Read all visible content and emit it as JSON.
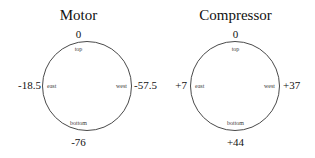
{
  "figure": {
    "background_color": "#ffffff",
    "stroke_color": "#4a4a4a",
    "text_color": "#111111"
  },
  "panels": [
    {
      "title": "Motor",
      "labels": {
        "top": "top",
        "bottom": "bottom",
        "east": "east",
        "west": "west"
      },
      "values": {
        "top": "0",
        "bottom": "-76",
        "east": "-18.5",
        "west": "-57.5"
      }
    },
    {
      "title": "Compressor",
      "labels": {
        "top": "top",
        "bottom": "bottom",
        "east": "east",
        "west": "west"
      },
      "values": {
        "top": "0",
        "bottom": "+44",
        "east": "+7",
        "west": "+37"
      }
    }
  ],
  "chart_data": {
    "type": "diagram",
    "title": "",
    "units": "",
    "series": [
      {
        "name": "Motor",
        "positions": [
          "top",
          "east",
          "west",
          "bottom"
        ],
        "values": [
          0,
          -18.5,
          -57.5,
          -76
        ]
      },
      {
        "name": "Compressor",
        "positions": [
          "top",
          "east",
          "west",
          "bottom"
        ],
        "values": [
          0,
          7,
          37,
          44
        ]
      }
    ]
  }
}
